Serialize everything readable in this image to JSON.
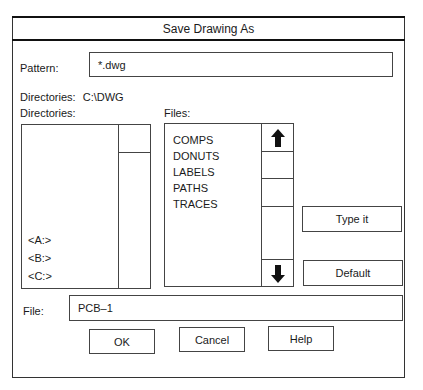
{
  "dialog": {
    "title": "Save Drawing As",
    "pattern": {
      "label": "Pattern:",
      "value": "*.dwg"
    },
    "current_directory": {
      "label": "Directories:",
      "value": "C:\\DWG"
    },
    "directories": {
      "label": "Directories:",
      "items": [
        "<A:>",
        "<B:>",
        "<C:>"
      ]
    },
    "files": {
      "label": "Files:",
      "items": [
        "COMPS",
        "DONUTS",
        "LABELS",
        "PATHS",
        "TRACES"
      ]
    },
    "side_buttons": {
      "type_it": "Type it",
      "default": "Default"
    },
    "file": {
      "label": "File:",
      "value": "PCB–1"
    },
    "buttons": {
      "ok": "OK",
      "cancel": "Cancel",
      "help": "Help"
    },
    "icons": {
      "scroll_up": "arrow-up-icon",
      "scroll_down": "arrow-down-icon"
    }
  }
}
